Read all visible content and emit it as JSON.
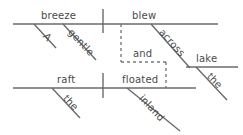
{
  "diagram": {
    "kind": "reed-kellogg-sentence-diagram",
    "sentence": "A gentle breeze blew across the lake and the raft floated inland",
    "canvas": {
      "width": 243,
      "height": 135,
      "background": "#ffffff"
    },
    "style": {
      "line_color": "#6b6b6b",
      "dashed_line_color": "#7a7a7a",
      "text_color": "#4a4a4a",
      "line_width": 1.4,
      "dash_pattern": "3,3"
    },
    "clauses": [
      {
        "id": "clause-top",
        "subject": "breeze",
        "verb": "blew",
        "modifiers": [
          "A",
          "gentle"
        ],
        "prepositional_phrase": {
          "preposition": "across",
          "object": "lake",
          "object_modifier": "the"
        }
      },
      {
        "id": "clause-bottom",
        "subject": "raft",
        "verb": "floated",
        "modifiers": [
          "the"
        ],
        "adverb": "inland"
      }
    ],
    "conjunction": "and",
    "lines": {
      "baselines": [
        {
          "name": "top-baseline",
          "x1": 13,
          "y1": 24,
          "x2": 218,
          "y2": 24
        },
        {
          "name": "bottom-baseline",
          "x1": 13,
          "y1": 88,
          "x2": 196,
          "y2": 88
        },
        {
          "name": "lake-baseline",
          "x1": 186,
          "y1": 67,
          "x2": 238,
          "y2": 67
        }
      ],
      "dividers": [
        {
          "name": "top-subject-verb-divider",
          "x1": 103,
          "y1": 9,
          "x2": 103,
          "y2": 33
        },
        {
          "name": "bottom-subject-verb-divider",
          "x1": 103,
          "y1": 73,
          "x2": 103,
          "y2": 98
        }
      ],
      "slants": [
        {
          "name": "slant-article-a",
          "x1": 34,
          "y1": 24,
          "x2": 56,
          "y2": 48
        },
        {
          "name": "slant-adjective-gentle",
          "x1": 63,
          "y1": 24,
          "x2": 96,
          "y2": 60
        },
        {
          "name": "slant-preposition-across",
          "x1": 151,
          "y1": 24,
          "x2": 190,
          "y2": 68
        },
        {
          "name": "slant-article-the-lake",
          "x1": 196,
          "y1": 67,
          "x2": 227,
          "y2": 100
        },
        {
          "name": "slant-article-the-raft",
          "x1": 52,
          "y1": 88,
          "x2": 80,
          "y2": 118
        },
        {
          "name": "slant-adverb-inland",
          "x1": 127,
          "y1": 88,
          "x2": 180,
          "y2": 131
        }
      ],
      "conjunction_path": [
        {
          "name": "conj-vertical-left",
          "x1": 121,
          "y1": 24,
          "x2": 121,
          "y2": 62
        },
        {
          "name": "conj-horizontal",
          "x1": 121,
          "y1": 62,
          "x2": 166,
          "y2": 62
        },
        {
          "name": "conj-vertical-right",
          "x1": 166,
          "y1": 62,
          "x2": 166,
          "y2": 88
        }
      ]
    },
    "labels": [
      {
        "name": "label-breeze",
        "text": "breeze",
        "x": 41,
        "y": 21,
        "rotate": 0,
        "size": 10
      },
      {
        "name": "label-blew",
        "text": "blew",
        "x": 132,
        "y": 21,
        "rotate": 0,
        "size": 10
      },
      {
        "name": "label-a",
        "text": "A",
        "x": 41,
        "y": 38,
        "rotate": 47,
        "size": 10
      },
      {
        "name": "label-gentle",
        "text": "gentle",
        "x": 66,
        "y": 34,
        "rotate": 47,
        "size": 10
      },
      {
        "name": "label-across",
        "text": "across",
        "x": 157,
        "y": 34,
        "rotate": 48,
        "size": 10
      },
      {
        "name": "label-lake",
        "text": "lake",
        "x": 196,
        "y": 64,
        "rotate": 0,
        "size": 10
      },
      {
        "name": "label-the-lake",
        "text": "the",
        "x": 205,
        "y": 78,
        "rotate": 47,
        "size": 10
      },
      {
        "name": "label-and",
        "text": "and",
        "x": 133,
        "y": 59,
        "rotate": 0,
        "size": 10
      },
      {
        "name": "label-raft",
        "text": "raft",
        "x": 57,
        "y": 85,
        "rotate": 0,
        "size": 10
      },
      {
        "name": "label-floated",
        "text": "floated",
        "x": 122,
        "y": 85,
        "rotate": 0,
        "size": 10
      },
      {
        "name": "label-the-raft",
        "text": "the",
        "x": 61,
        "y": 100,
        "rotate": 47,
        "size": 10
      },
      {
        "name": "label-inland",
        "text": "inland",
        "x": 137,
        "y": 100,
        "rotate": 47,
        "size": 10
      }
    ]
  }
}
